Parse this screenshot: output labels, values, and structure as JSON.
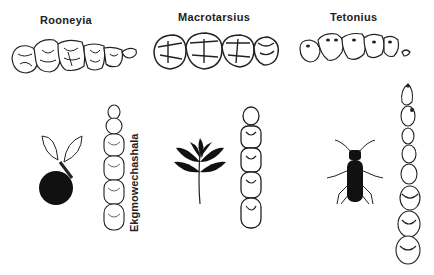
{
  "figure": {
    "type": "dental comparison diagram of fossil primates with dietary icons",
    "panels": [
      {
        "label": "Rooneyia",
        "diet_icon": "fruit-icon",
        "view": "upper toothrow occlusal"
      },
      {
        "label": "Macrotarsius",
        "diet_icon": "leaf-icon",
        "view": "upper toothrow occlusal"
      },
      {
        "label": "Tetonius",
        "diet_icon": "insect-icon",
        "view": "upper toothrow occlusal"
      }
    ],
    "vertical_label": "Ekgmowechashala",
    "colors": {
      "ink": "#222222",
      "background": "#ffffff"
    }
  }
}
